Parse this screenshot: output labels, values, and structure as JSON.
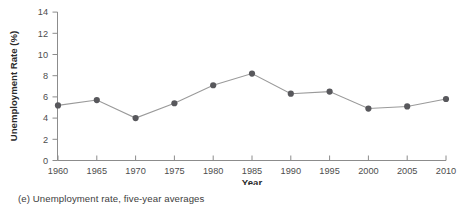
{
  "caption": "(e) Unemployment rate, five-year averages",
  "chart_data": {
    "type": "line",
    "title": "",
    "xlabel": "Year",
    "ylabel": "Unemployment Rate (%)",
    "x": [
      1960,
      1965,
      1970,
      1975,
      1980,
      1985,
      1990,
      1995,
      2000,
      2005,
      2010
    ],
    "values": [
      5.2,
      5.7,
      4.0,
      5.4,
      7.1,
      8.2,
      6.3,
      6.5,
      4.9,
      5.1,
      5.8
    ],
    "categories": [
      "1960",
      "1965",
      "1970",
      "1975",
      "1980",
      "1985",
      "1990",
      "1995",
      "2000",
      "2005",
      "2010"
    ],
    "xlim": [
      1960,
      2010
    ],
    "ylim": [
      0,
      14
    ],
    "ytick_step": 2,
    "xtick_step": 5,
    "yticks": [
      0,
      2,
      4,
      6,
      8,
      10,
      12,
      14
    ],
    "ytick_labels": [
      "0",
      "2",
      "4",
      "6",
      "8",
      "10",
      "12",
      "14"
    ],
    "xticks": [
      1960,
      1965,
      1970,
      1975,
      1980,
      1985,
      1990,
      1995,
      2000,
      2005,
      2010
    ],
    "xtick_labels": [
      "1960",
      "1965",
      "1970",
      "1975",
      "1980",
      "1985",
      "1990",
      "1995",
      "2000",
      "2005",
      "2010"
    ],
    "grid": false,
    "legend": "none",
    "series": [
      {
        "name": "Unemployment rate",
        "values": [
          5.2,
          5.7,
          4.0,
          5.4,
          7.1,
          8.2,
          6.3,
          6.5,
          4.9,
          5.1,
          5.8
        ]
      }
    ],
    "marker": "circle",
    "colors": {
      "line": "#9a9a9a",
      "marker": "#58585c",
      "axis": "#8c8c8c",
      "text": "#4d4d4d"
    },
    "spines": [
      "left",
      "bottom"
    ]
  }
}
